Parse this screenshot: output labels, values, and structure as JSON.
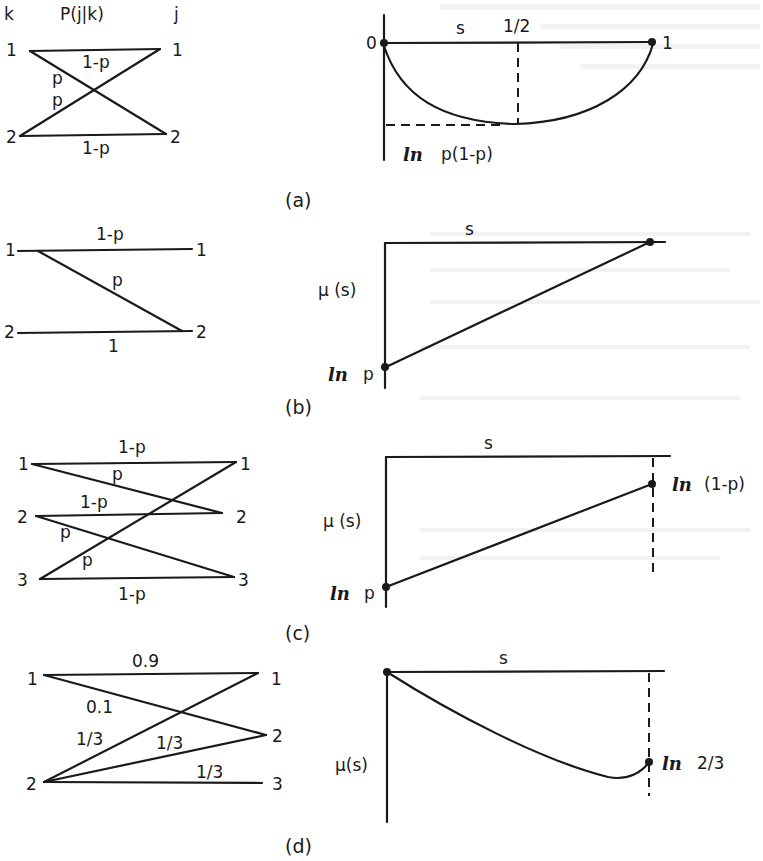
{
  "figure": {
    "panels": [
      {
        "caption": "(a)",
        "channel": {
          "header_input": "k",
          "header_title": "P(j|k)",
          "header_output": "j",
          "inputs": [
            "1",
            "2"
          ],
          "outputs": [
            "1",
            "2"
          ],
          "edges": [
            {
              "from": "1",
              "to": "1",
              "label": "1-p"
            },
            {
              "from": "1",
              "to": "2",
              "label": "p"
            },
            {
              "from": "2",
              "to": "1",
              "label": "p"
            },
            {
              "from": "2",
              "to": "2",
              "label": "1-p"
            }
          ]
        },
        "plot": {
          "x_label": "s",
          "origin_label": "0",
          "x_end_label": "1",
          "mid_label": "1/2",
          "min_label_prefix": "ln",
          "min_label": "p(1-p)"
        }
      },
      {
        "caption": "(b)",
        "channel": {
          "inputs": [
            "1",
            "2"
          ],
          "outputs": [
            "1",
            "2"
          ],
          "edges": [
            {
              "from": "1",
              "to": "1",
              "label": "1-p"
            },
            {
              "from": "1",
              "to": "2",
              "label": "p"
            },
            {
              "from": "2",
              "to": "2",
              "label": "1"
            }
          ]
        },
        "plot": {
          "x_label": "s",
          "y_label": "μ (s)",
          "start_label_prefix": "ln",
          "start_label": "p"
        }
      },
      {
        "caption": "(c)",
        "channel": {
          "inputs": [
            "1",
            "2",
            "3"
          ],
          "outputs": [
            "1",
            "2",
            "3"
          ],
          "edges": [
            {
              "from": "1",
              "to": "1",
              "label": "1-p"
            },
            {
              "from": "1",
              "to": "2",
              "label": "p"
            },
            {
              "from": "2",
              "to": "2",
              "label": "1-p"
            },
            {
              "from": "2",
              "to": "3",
              "label": "p"
            },
            {
              "from": "3",
              "to": "1",
              "label": "p"
            },
            {
              "from": "3",
              "to": "3",
              "label": "1-p"
            }
          ]
        },
        "plot": {
          "x_label": "s",
          "y_label": "μ (s)",
          "start_label_prefix": "ln",
          "start_label": "p",
          "end_label_prefix": "ln",
          "end_label": "(1-p)"
        }
      },
      {
        "caption": "(d)",
        "channel": {
          "inputs": [
            "1",
            "2"
          ],
          "outputs": [
            "1",
            "2",
            "3"
          ],
          "edges": [
            {
              "from": "1",
              "to": "1",
              "label": "0.9"
            },
            {
              "from": "1",
              "to": "2",
              "label": "0.1"
            },
            {
              "from": "2",
              "to": "1",
              "label": "1/3"
            },
            {
              "from": "2",
              "to": "2",
              "label": "1/3"
            },
            {
              "from": "2",
              "to": "3",
              "label": "1/3"
            }
          ]
        },
        "plot": {
          "x_label": "s",
          "y_label": "μ(s)",
          "end_label_prefix": "ln",
          "end_label": "2/3"
        }
      }
    ]
  }
}
